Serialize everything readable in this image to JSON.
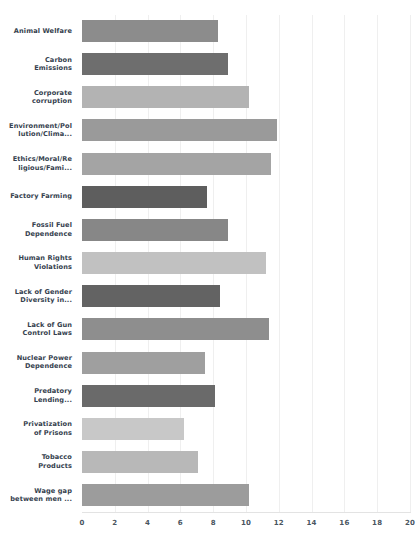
{
  "chart_data": {
    "type": "bar",
    "orientation": "horizontal",
    "title": "",
    "xlabel": "",
    "ylabel": "",
    "xlim": [
      0,
      20
    ],
    "xticks": [
      0,
      2,
      4,
      6,
      8,
      10,
      12,
      14,
      16,
      18,
      20
    ],
    "grid": true,
    "legend": false,
    "categories": [
      "Animal Welfare",
      "Carbon Emissions",
      "Corporate corruption",
      "Environment/Pollution/Clima...",
      "Ethics/Moral/Religious/Fami...",
      "Factory Farming",
      "Fossil Fuel Dependence",
      "Human Rights Violations",
      "Lack of Gender Diversity in...",
      "Lack of Gun Control Laws",
      "Nuclear Power Dependence",
      "Predatory Lending...",
      "Privatization of Prisons",
      "Tobacco Products",
      "Wage gap between men ..."
    ],
    "values": [
      8.3,
      8.9,
      10.2,
      11.9,
      11.5,
      7.6,
      8.9,
      11.2,
      8.4,
      11.4,
      7.5,
      8.1,
      6.2,
      7.1,
      10.2
    ],
    "bar_colors": [
      "#8c8c8c",
      "#6e6e6e",
      "#b3b3b3",
      "#9a9a9a",
      "#a4a4a4",
      "#5e5e5e",
      "#878787",
      "#c1c1c1",
      "#636363",
      "#8e8e8e",
      "#9f9f9f",
      "#6a6a6a",
      "#c8c8c8",
      "#b8b8b8",
      "#9c9c9c"
    ]
  },
  "axis": {
    "tick_labels": [
      "0",
      "2",
      "4",
      "6",
      "8",
      "10",
      "12",
      "14",
      "16",
      "18",
      "20"
    ]
  },
  "labels": {
    "lines": [
      [
        "Animal Welfare"
      ],
      [
        "Carbon",
        "Emissions"
      ],
      [
        "Corporate",
        "corruption"
      ],
      [
        "Environment/Pol",
        "lution/Clima..."
      ],
      [
        "Ethics/Moral/Re",
        "ligious/Fami..."
      ],
      [
        "Factory Farming"
      ],
      [
        "Fossil Fuel",
        "Dependence"
      ],
      [
        "Human Rights",
        "Violations"
      ],
      [
        "Lack of Gender",
        "Diversity in..."
      ],
      [
        "Lack of Gun",
        "Control Laws"
      ],
      [
        "Nuclear Power",
        "Dependence"
      ],
      [
        "Predatory",
        "Lending..."
      ],
      [
        "Privatization",
        "of Prisons"
      ],
      [
        "Tobacco",
        "Products"
      ],
      [
        "Wage gap",
        "between men ..."
      ]
    ]
  },
  "top_clipped_text": "..."
}
